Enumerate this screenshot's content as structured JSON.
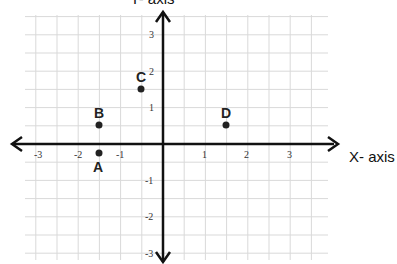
{
  "chart_data": {
    "type": "scatter",
    "title": "",
    "xlabel": "X- axis",
    "ylabel": "Y- axis",
    "xlim": [
      -3.5,
      4
    ],
    "ylim": [
      -3.5,
      3.5
    ],
    "grid": true,
    "grid_step": 0.5,
    "x_ticks": [
      "-3",
      "-2",
      "-1",
      "1",
      "2",
      "3"
    ],
    "y_ticks": [
      "3",
      "2",
      "1",
      "-1",
      "-2",
      "-3"
    ],
    "points": [
      {
        "label": "A",
        "x": -1.5,
        "y": -0.25
      },
      {
        "label": "B",
        "x": -1.5,
        "y": 0.5
      },
      {
        "label": "C",
        "x": -0.5,
        "y": 1.5
      },
      {
        "label": "D",
        "x": 1.5,
        "y": 0.5
      }
    ]
  }
}
